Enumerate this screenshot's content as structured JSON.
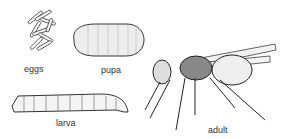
{
  "diagram": {
    "stages": [
      {
        "id": "eggs",
        "label": "eggs"
      },
      {
        "id": "pupa",
        "label": "pupa"
      },
      {
        "id": "larva",
        "label": "larva"
      },
      {
        "id": "adult",
        "label": "adult"
      }
    ],
    "colors": {
      "ink": "#333333",
      "background": "#ffffff"
    }
  }
}
